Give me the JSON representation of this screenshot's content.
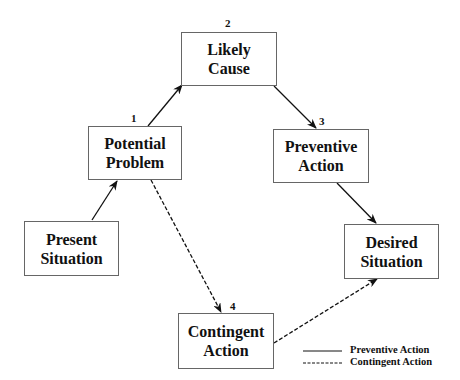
{
  "nodes": {
    "present": {
      "line1": "Present",
      "line2": "Situation"
    },
    "potential": {
      "line1": "Potential",
      "line2": "Problem",
      "number": "1"
    },
    "likely": {
      "line1": "Likely",
      "line2": "Cause",
      "number": "2"
    },
    "preventive": {
      "line1": "Preventive",
      "line2": "Action",
      "number": "3"
    },
    "contingent": {
      "line1": "Contingent",
      "line2": "Action",
      "number": "4"
    },
    "desired": {
      "line1": "Desired",
      "line2": "Situation"
    }
  },
  "edges": [
    {
      "from": "Present Situation",
      "to": "Potential Problem",
      "style": "solid"
    },
    {
      "from": "Potential Problem",
      "to": "Likely Cause",
      "style": "solid"
    },
    {
      "from": "Likely Cause",
      "to": "Preventive Action",
      "style": "solid"
    },
    {
      "from": "Preventive Action",
      "to": "Desired Situation",
      "style": "solid"
    },
    {
      "from": "Potential Problem",
      "to": "Contingent Action",
      "style": "dashed"
    },
    {
      "from": "Contingent Action",
      "to": "Desired Situation",
      "style": "dashed"
    }
  ],
  "legend": {
    "solid": "Preventive Action",
    "dashed": "Contingent Action"
  }
}
